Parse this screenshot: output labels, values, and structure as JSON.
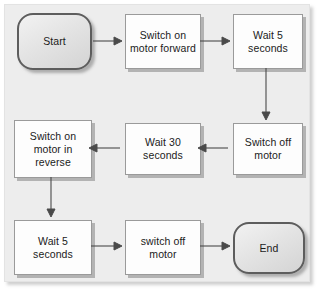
{
  "diagram": {
    "type": "flowchart",
    "canvas": {
      "background_color": "#ededed",
      "page_color": "#ffffff",
      "width": 318,
      "height": 291
    },
    "styles": {
      "process_fill": "#fdfdfd",
      "process_border": "#9a9a9a",
      "process_shadow": "#b3b3b3",
      "terminator_fill": "#e4e4e4",
      "terminator_border": "#5d5d5d",
      "connector_color": "#4a4a4a",
      "text_color": "#1b1b1b"
    },
    "nodes": [
      {
        "id": "start",
        "shape": "terminator",
        "label": "Start",
        "x": 16,
        "y": 12,
        "w": 75,
        "h": 57
      },
      {
        "id": "motor_fwd",
        "shape": "process",
        "label": "Switch on\nmotor forward",
        "x": 124,
        "y": 13,
        "w": 76,
        "h": 55
      },
      {
        "id": "wait5_top",
        "shape": "process",
        "label": "Wait 5\nseconds",
        "x": 232,
        "y": 13,
        "w": 70,
        "h": 55
      },
      {
        "id": "motor_off_1",
        "shape": "process",
        "label": "Switch off\nmotor",
        "x": 232,
        "y": 122,
        "w": 70,
        "h": 52
      },
      {
        "id": "wait30",
        "shape": "process",
        "label": "Wait 30\nseconds",
        "x": 124,
        "y": 122,
        "w": 76,
        "h": 52
      },
      {
        "id": "motor_rev",
        "shape": "process",
        "label": "Switch on\nmotor in\nreverse",
        "x": 13,
        "y": 119,
        "w": 78,
        "h": 58
      },
      {
        "id": "wait5_bottom",
        "shape": "process",
        "label": "Wait 5\nseconds",
        "x": 13,
        "y": 219,
        "w": 78,
        "h": 55
      },
      {
        "id": "motor_off_2",
        "shape": "process",
        "label": "switch off\nmotor",
        "x": 124,
        "y": 219,
        "w": 76,
        "h": 55
      },
      {
        "id": "end",
        "shape": "terminator",
        "label": "End",
        "x": 232,
        "y": 221,
        "w": 72,
        "h": 52
      }
    ],
    "edges": [
      {
        "id": "e1",
        "from": "start",
        "to": "motor_fwd",
        "direction": "right",
        "x1": 93,
        "y1": 41,
        "x2": 120,
        "y2": 41
      },
      {
        "id": "e2",
        "from": "motor_fwd",
        "to": "wait5_top",
        "direction": "right",
        "x1": 203,
        "y1": 41,
        "x2": 228,
        "y2": 41
      },
      {
        "id": "e3",
        "from": "wait5_top",
        "to": "motor_off_1",
        "direction": "down",
        "x1": 267,
        "y1": 70,
        "x2": 267,
        "y2": 118
      },
      {
        "id": "e4",
        "from": "motor_off_1",
        "to": "wait30",
        "direction": "left",
        "x1": 229,
        "y1": 149,
        "x2": 204,
        "y2": 149
      },
      {
        "id": "e5",
        "from": "wait30",
        "to": "motor_rev",
        "direction": "left",
        "x1": 121,
        "y1": 149,
        "x2": 95,
        "y2": 149
      },
      {
        "id": "e6",
        "from": "motor_rev",
        "to": "wait5_bottom",
        "direction": "down",
        "x1": 52,
        "y1": 179,
        "x2": 52,
        "y2": 215
      },
      {
        "id": "e7",
        "from": "wait5_bottom",
        "to": "motor_off_2",
        "direction": "right",
        "x1": 94,
        "y1": 247,
        "x2": 120,
        "y2": 247
      },
      {
        "id": "e8",
        "from": "motor_off_2",
        "to": "end",
        "direction": "right",
        "x1": 203,
        "y1": 247,
        "x2": 228,
        "y2": 247
      }
    ]
  }
}
